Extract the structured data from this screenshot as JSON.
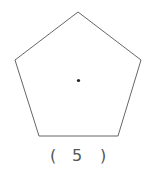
{
  "figure": {
    "shape": "regular-pentagon",
    "stroke_color": "#666666",
    "center_dot": true,
    "label": {
      "open": "(",
      "value": "5",
      "close": ")"
    }
  }
}
